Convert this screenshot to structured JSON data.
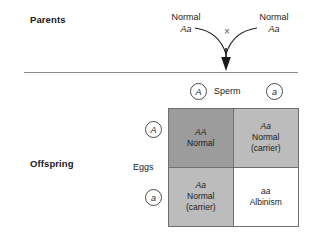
{
  "labels": {
    "parents": "Parents",
    "offspring": "Offspring"
  },
  "parents": {
    "left": {
      "phenotype": "Normal",
      "genotype": "Aa"
    },
    "right": {
      "phenotype": "Normal",
      "genotype": "Aa"
    },
    "cross_symbol": "×"
  },
  "gametes": {
    "sperm_label": "Sperm",
    "sperm_alleles": [
      "A",
      "a"
    ],
    "eggs_label": "Eggs",
    "egg_alleles": [
      "A",
      "a"
    ]
  },
  "punnett": {
    "cells": [
      {
        "genotype": "AA",
        "phenotype": "Normal",
        "note": "",
        "fill": "#9c9c9c"
      },
      {
        "genotype": "Aa",
        "phenotype": "Normal",
        "note": "(carrier)",
        "fill": "#bcbcbc"
      },
      {
        "genotype": "Aa",
        "phenotype": "Normal",
        "note": "(carrier)",
        "fill": "#bcbcbc"
      },
      {
        "genotype": "aa",
        "phenotype": "Albinism",
        "note": "",
        "fill": "#ffffff"
      }
    ]
  },
  "colors": {
    "line": "#6f6f6f",
    "divider": "#8c8c8c",
    "text": "#1a1a1a"
  }
}
